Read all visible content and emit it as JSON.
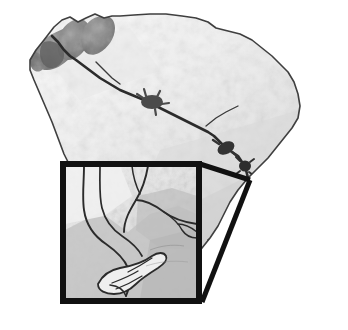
{
  "figure": {
    "kind": "map-figure",
    "caption": "",
    "background_color": "#ffffff",
    "width": 348,
    "height": 330
  },
  "map": {
    "title": "",
    "region_name": "South Carolina",
    "style": "grayscale shaded-relief silhouette",
    "outline_color": "#3a3a3a",
    "fill_light": "#f2f2f2",
    "fill_mid": "#d8d8d8",
    "fill_dark": "#8a8a8a",
    "outline_path": "M 30 60 L 36 50 L 44 40 L 54 27 L 62 20 L 70 17 L 78 22 L 86 18 L 95 14 L 104 18 L 112 16 L 120 16 L 134 15 L 150 14 L 166 14 L 182 16 L 196 18 L 208 22 L 216 28 L 228 31 L 240 34 L 252 40 L 262 48 L 272 56 L 280 64 L 288 72 L 294 82 L 298 94 L 300 106 L 298 118 L 292 128 L 284 138 L 276 148 L 268 158 L 258 168 L 248 178 L 238 190 L 230 202 L 224 214 L 218 226 L 210 238 L 202 248 L 196 256 L 190 262 L 182 266 L 172 266 L 160 262 L 148 256 L 136 248 L 124 238 L 112 226 L 100 212 L 90 198 L 80 184 L 72 170 L 64 154 L 58 138 L 52 122 L 46 108 L 40 94 L 34 80 L 30 70 Z",
    "mountain_shading_note": "dark mountain ridges in the northwest corner",
    "river": {
      "name": "river course",
      "color": "#2e2e2e",
      "path": "M 52 36 L 58 42 L 64 50 L 70 56 L 76 60 L 84 66 L 92 72 L 100 78 L 110 84 L 120 90 L 132 95 L 144 100 L 152 104 L 160 108 L 168 112 L 176 116 L 184 120 L 192 124 L 200 128 L 208 132 L 214 136 L 220 142 L 226 148 L 232 152 L 238 156 L 242 162 L 246 170 L 248 178 L 248 186 L 246 194 L 242 202 L 238 210 L 232 218"
    },
    "reservoirs": [
      {
        "name": "upper-reservoir",
        "cx": 152,
        "cy": 102,
        "rx": 11,
        "ry": 7
      },
      {
        "name": "mid-reservoir",
        "cx": 226,
        "cy": 148,
        "rx": 9,
        "ry": 6
      },
      {
        "name": "lower-reservoir",
        "cx": 245,
        "cy": 165,
        "rx": 6,
        "ry": 6
      }
    ]
  },
  "inset": {
    "label": "",
    "frame_color": "#111111",
    "frame_thickness": 6,
    "x": 60,
    "y": 161,
    "width": 142,
    "height": 143,
    "contents_description": "detailed estuary and tidal channel network",
    "interior_fill_light": "#efefef",
    "interior_fill_mid": "#cccccc",
    "channel_color": "#2b2b2b"
  },
  "callout": {
    "description": "wedge leader lines connecting inset frame corners to the coastal study site",
    "color": "#111111",
    "thickness": 5,
    "target_point_x": 250,
    "target_point_y": 180,
    "upper_leader": "M 202 163 L 250 180",
    "lower_leader": "M 202 302 L 250 180"
  },
  "accessibility": {
    "alt_text": "Grayscale map of South Carolina showing a river course with reservoirs, with a square inset panel detailing a coastal estuary connected by leader lines."
  }
}
